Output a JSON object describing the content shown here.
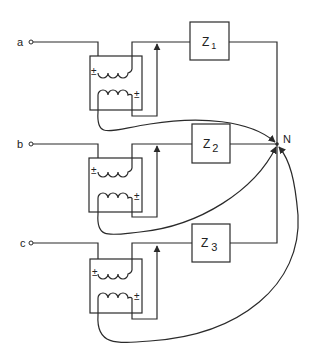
{
  "diagram": {
    "type": "circuit",
    "phases": [
      {
        "terminal_label": "a",
        "impedance_label": "Z",
        "impedance_sub": "1",
        "primary_polarity": "±",
        "secondary_polarity": "±"
      },
      {
        "terminal_label": "b",
        "impedance_label": "Z",
        "impedance_sub": "2",
        "primary_polarity": "±",
        "secondary_polarity": "±"
      },
      {
        "terminal_label": "c",
        "impedance_label": "Z",
        "impedance_sub": "3",
        "primary_polarity": "±",
        "secondary_polarity": "±"
      }
    ],
    "neutral_label": "N",
    "colors": {
      "line": "#2a2a2a",
      "background": "#ffffff"
    }
  }
}
